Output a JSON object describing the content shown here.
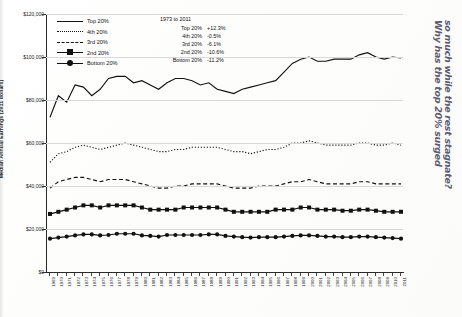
{
  "chart_data": {
    "type": "line",
    "title": "",
    "xlabel": "",
    "ylabel": "Median Annual Earnings (2011 dollars)",
    "ylim": [
      0,
      120000
    ],
    "ytick_labels": [
      "$120,000",
      "$100,000",
      "$80,000",
      "$60,000",
      "$40,000",
      "$20,000",
      "$0"
    ],
    "ytick_values": [
      120000,
      100000,
      80000,
      60000,
      40000,
      20000,
      0
    ],
    "grid": true,
    "legend_position": "top-left",
    "x": [
      1969,
      1970,
      1971,
      1972,
      1973,
      1974,
      1975,
      1976,
      1977,
      1978,
      1979,
      1980,
      1981,
      1982,
      1983,
      1984,
      1985,
      1986,
      1987,
      1988,
      1989,
      1990,
      1991,
      1992,
      1993,
      1994,
      1995,
      1996,
      1997,
      1998,
      1999,
      2000,
      2001,
      2002,
      2003,
      2004,
      2005,
      2006,
      2007,
      2008,
      2009,
      2010,
      2011
    ],
    "categories": [
      "1969",
      "1970",
      "1971",
      "1972",
      "1973",
      "1974",
      "1975",
      "1976",
      "1977",
      "1978",
      "1979",
      "1980",
      "1981",
      "1982",
      "1983",
      "1984",
      "1985",
      "1986",
      "1987",
      "1988",
      "1989",
      "1990",
      "1991",
      "1992",
      "1993",
      "1994",
      "1995",
      "1996",
      "1997",
      "1998",
      "1999",
      "2000",
      "2001",
      "2002",
      "2003",
      "2004",
      "2005",
      "2006",
      "2007",
      "2008",
      "2009",
      "2010",
      "2011"
    ],
    "series": [
      {
        "name": "Top 20%",
        "style": "solid",
        "marker": "none",
        "values": [
          72000,
          82000,
          79000,
          87000,
          86000,
          82000,
          85000,
          90000,
          91000,
          91000,
          88000,
          89000,
          87000,
          85000,
          88000,
          90000,
          90000,
          89000,
          87000,
          88000,
          85000,
          84000,
          83000,
          85000,
          86000,
          87000,
          88000,
          89000,
          93000,
          97000,
          99000,
          100000,
          98000,
          98000,
          99000,
          99000,
          99000,
          101000,
          102000,
          100000,
          99000,
          100000,
          99500
        ]
      },
      {
        "name": "4th 20%",
        "style": "dotted",
        "marker": "none",
        "values": [
          51000,
          55000,
          56000,
          58000,
          59000,
          58000,
          57000,
          58000,
          59000,
          60000,
          59000,
          58000,
          57000,
          56000,
          56000,
          57000,
          57000,
          58000,
          58000,
          58000,
          58000,
          57000,
          56000,
          56000,
          55000,
          56000,
          57000,
          57000,
          58000,
          60000,
          60000,
          61000,
          60000,
          59000,
          59000,
          59000,
          59000,
          60000,
          60000,
          59000,
          59000,
          60000,
          59000
        ]
      },
      {
        "name": "3rd 20%",
        "style": "dashed",
        "marker": "none",
        "values": [
          39000,
          42000,
          43000,
          44000,
          44000,
          43000,
          42000,
          43000,
          43000,
          43000,
          42000,
          41000,
          40000,
          39000,
          39000,
          40000,
          40000,
          41000,
          41000,
          41000,
          41000,
          40000,
          39000,
          39000,
          39000,
          40000,
          40000,
          40000,
          41000,
          42000,
          42000,
          43000,
          42000,
          41000,
          41000,
          41000,
          41000,
          42000,
          42000,
          41000,
          41000,
          41000,
          41000
        ]
      },
      {
        "name": "2nd 20%",
        "style": "solid",
        "marker": "square",
        "values": [
          27000,
          28000,
          29000,
          30000,
          31000,
          31000,
          30000,
          31000,
          31000,
          31000,
          31000,
          30000,
          29000,
          29000,
          29000,
          29000,
          30000,
          30000,
          30000,
          30000,
          30000,
          29000,
          28000,
          28000,
          28000,
          28000,
          28000,
          29000,
          29000,
          29000,
          30000,
          30000,
          29000,
          29000,
          29000,
          28500,
          28500,
          29000,
          29000,
          28500,
          28000,
          28000,
          28000
        ]
      },
      {
        "name": "Bottom 20%",
        "style": "solid",
        "marker": "circle",
        "values": [
          15500,
          16000,
          16500,
          17000,
          17500,
          17500,
          17000,
          17200,
          17800,
          17800,
          17800,
          17000,
          16800,
          16500,
          17200,
          17200,
          17200,
          17200,
          17200,
          17500,
          17500,
          16800,
          16500,
          16200,
          16000,
          16200,
          16200,
          16200,
          16500,
          16800,
          17000,
          17000,
          16800,
          16500,
          16500,
          16200,
          16200,
          16500,
          16500,
          16200,
          16000,
          15800,
          15500
        ]
      }
    ],
    "annotation": {
      "title": "1973 to 2011",
      "rows": [
        {
          "name": "Top 20%",
          "value": "+12.3%"
        },
        {
          "name": "4th 20%",
          "value": "-0.5%"
        },
        {
          "name": "3rd 20%",
          "value": "-6.1%"
        },
        {
          "name": "2nd 20%",
          "value": "-10.6%"
        },
        {
          "name": "Bottom 20%",
          "value": "-11.2%"
        }
      ]
    }
  },
  "legend": {
    "items": [
      {
        "label": "Top 20%",
        "style": "solid"
      },
      {
        "label": "4th 20%",
        "style": "dotted"
      },
      {
        "label": "3rd 20%",
        "style": "dashed"
      },
      {
        "label": "2nd 20%",
        "style": "square"
      },
      {
        "label": "Bottom 20%",
        "style": "circle"
      }
    ]
  },
  "handwriting": {
    "line1": "Why has the top 20% surged",
    "line2": "so much while the rest stagnate?"
  },
  "colors": {
    "line": "#111111",
    "grid": "#d8d8d8",
    "axis": "#2a2a2a",
    "ink": "#3a3a52"
  }
}
